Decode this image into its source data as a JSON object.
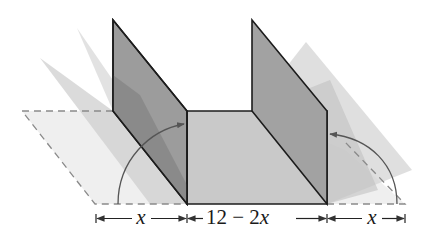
{
  "diagram": {
    "colors": {
      "background": "#ffffff",
      "flat_flap": "#eeeeee",
      "ghost_light": "#d9d9d9",
      "ghost_mid": "#c4c4c4",
      "wall": "#9a9a9a",
      "wall_overlap": "#808080",
      "base": "#c8c8c8",
      "edge": "#1c1c1c",
      "dashed": "#8a8a8a",
      "arrow": "#555555"
    },
    "dimensions": {
      "left": {
        "variable": "x",
        "text": "x"
      },
      "middle": {
        "text_num": "12 − 2",
        "variable": "x"
      },
      "right": {
        "variable": "x",
        "text": "x"
      }
    },
    "annotations": {
      "fold_arrow_left": "rotation arrow showing left flap folding up",
      "fold_arrow_right": "rotation arrow showing right flap folding up"
    }
  }
}
